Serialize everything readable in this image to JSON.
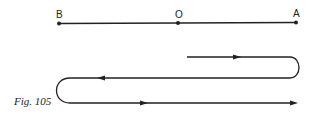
{
  "points": [
    {
      "label": "B",
      "x": 59
    },
    {
      "label": "O",
      "x": 178
    },
    {
      "label": "A",
      "x": 296
    }
  ],
  "caption": "Fig. 105",
  "colors": {
    "ink": "#222222",
    "background": "#ffffff"
  }
}
